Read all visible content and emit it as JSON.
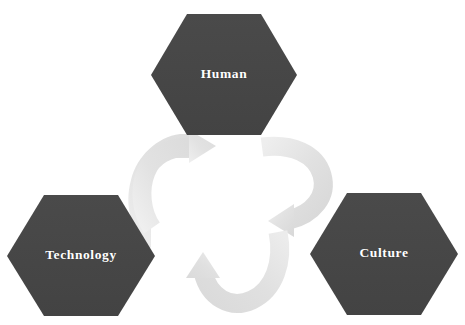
{
  "diagram": {
    "type": "cycle",
    "background_color": "#ffffff",
    "node_fill_color": "#474747",
    "node_text_color": "#ffffff",
    "arrow_color": "#e6e6e6",
    "arrow_color_dark": "#d6d6d6",
    "node_shape": "hexagon",
    "nodes": [
      {
        "id": "human",
        "label": "Human",
        "position": "top-center",
        "center_x": 224,
        "center_y": 75,
        "width": 146,
        "height": 122
      },
      {
        "id": "technology",
        "label": "Technology",
        "position": "bottom-left",
        "center_x": 81,
        "center_y": 256,
        "width": 148,
        "height": 122
      },
      {
        "id": "culture",
        "label": "Culture",
        "position": "bottom-right",
        "center_x": 384,
        "center_y": 254,
        "width": 148,
        "height": 122
      }
    ],
    "arrows": [
      {
        "id": "arrow-technology-to-human",
        "from": "technology",
        "to": "human",
        "direction": "counter-clockwise-up-right",
        "head_points": "upper-right"
      },
      {
        "id": "arrow-human-to-culture",
        "from": "human",
        "to": "culture",
        "direction": "clockwise-down-right",
        "head_points": "lower-left"
      },
      {
        "id": "arrow-culture-to-technology",
        "from": "culture",
        "to": "technology",
        "direction": "clockwise-down-left",
        "head_points": "upper-left"
      }
    ]
  }
}
